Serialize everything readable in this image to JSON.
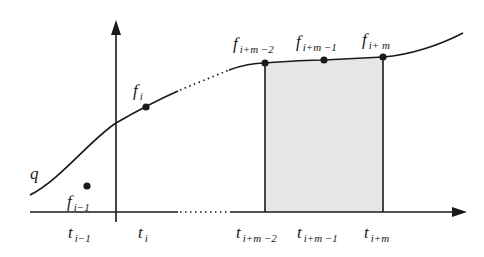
{
  "diagram": {
    "title": "",
    "colors": {
      "stroke": "#1a1a1a",
      "shade": "#e6e6e6",
      "background": "#ffffff"
    },
    "axes": {
      "vertical": {
        "x": 116,
        "top": 20,
        "bottom": 222
      },
      "horizontal": {
        "y": 212,
        "left": 30,
        "right": 467,
        "dotted_from": 180,
        "dotted_to": 229
      }
    },
    "curve": {
      "label": "q",
      "label_pos": [
        30,
        179
      ],
      "solid_segment_1": "M 30 195 C 60 180, 90 140, 116 123 C 135 112, 160 99, 178 91",
      "dotted_segment": "M 180 90 L 229 70",
      "solid_segment_2": "M 229 70 C 240 66, 255 63, 265 63 C 290 61, 310 60, 324 60 C 345 59, 365 58, 383 57 C 410 55, 440 45, 463 33"
    },
    "shaded_region": {
      "x1": 265,
      "x2": 383,
      "label": "integral area"
    },
    "points": [
      {
        "name": "f_{i-1}",
        "base": "f",
        "sub": "i−1",
        "x": 87,
        "y": 186,
        "label_x": 67,
        "label_y": 207,
        "on_curve": false
      },
      {
        "name": "f_i",
        "base": "f",
        "sub": "i",
        "x": 146,
        "y": 107,
        "label_x": 133,
        "label_y": 96,
        "on_curve": true
      },
      {
        "name": "f_{i+m-2}",
        "base": "f",
        "sub": "i+m −2",
        "x": 265,
        "y": 63,
        "label_x": 233,
        "label_y": 49,
        "on_curve": true
      },
      {
        "name": "f_{i+m-1}",
        "base": "f",
        "sub": "i+m −1",
        "x": 324,
        "y": 60,
        "label_x": 296,
        "label_y": 47,
        "on_curve": true
      },
      {
        "name": "f_{i+m}",
        "base": "f",
        "sub": "i+ m",
        "x": 383,
        "y": 57,
        "label_x": 362,
        "label_y": 45,
        "on_curve": true
      }
    ],
    "ticks": [
      {
        "name": "t_{i-1}",
        "base": "t",
        "sub": "i−1",
        "label_x": 68,
        "label_y": 238
      },
      {
        "name": "t_i",
        "base": "t",
        "sub": "i",
        "label_x": 138,
        "label_y": 238
      },
      {
        "name": "t_{i+m-2}",
        "base": "t",
        "sub": "i+m −2",
        "label_x": 236,
        "label_y": 238
      },
      {
        "name": "t_{i+m-1}",
        "base": "t",
        "sub": "i+m −1",
        "label_x": 297,
        "label_y": 238
      },
      {
        "name": "t_{i+m}",
        "base": "t",
        "sub": "i+m",
        "label_x": 364,
        "label_y": 238
      }
    ]
  }
}
